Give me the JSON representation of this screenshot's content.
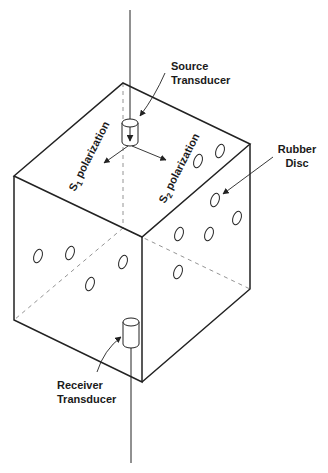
{
  "diagram": {
    "type": "isometric cube experimental setup",
    "labels": {
      "source_line1": "Source",
      "source_line2": "Transducer",
      "rubber_line1": "Rubber",
      "rubber_line2": "Disc",
      "receiver_line1": "Receiver",
      "receiver_line2": "Transducer",
      "s1_letter": "S",
      "s1_sub": "1",
      "s1_text": "polarization",
      "s2_letter": "S",
      "s2_sub": "2",
      "s2_text": "polarization"
    },
    "components": [
      "cube sample",
      "source transducer (top face)",
      "receiver transducer (bottom face)",
      "rubber discs on side faces",
      "S1 polarization arrow",
      "S2 polarization arrow"
    ],
    "colors": {
      "line": "#222222",
      "hidden_line": "#888888",
      "background": "#ffffff"
    }
  }
}
